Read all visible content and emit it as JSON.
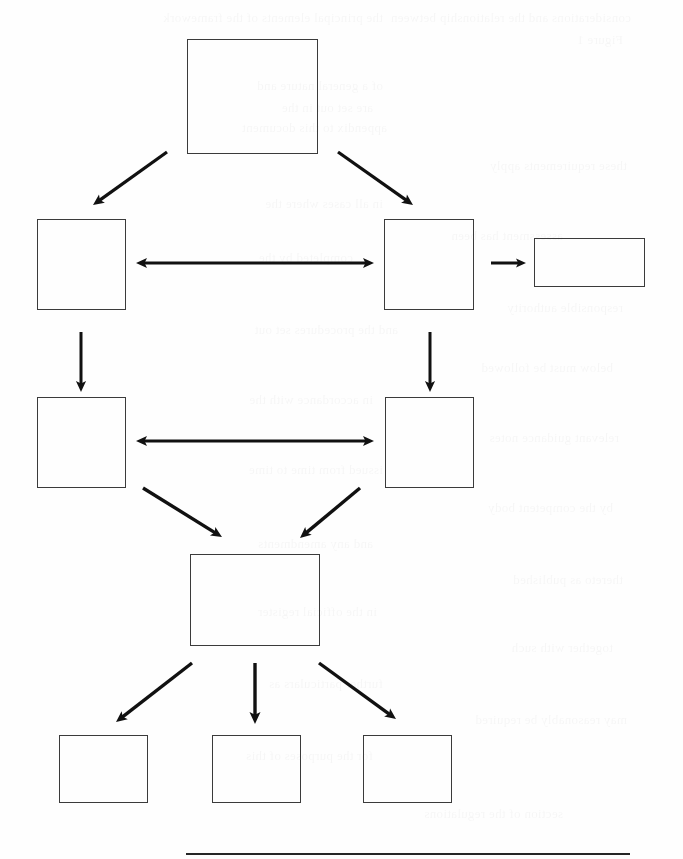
{
  "page": {
    "width": 683,
    "height": 859,
    "background_color": "#fefefe",
    "stroke_color": "#3b3b3b",
    "arrow_color": "#111111",
    "rule_color": "#262626"
  },
  "diagram": {
    "type": "flowchart",
    "orientation": "top-down",
    "node_count": 9,
    "arrow_count": 12,
    "nodes_have_labels": false,
    "nodes": [
      {
        "id": "node-root",
        "name": "root-node",
        "row": 1,
        "label": "",
        "x": 187,
        "y": 39,
        "width": 131,
        "height": 115
      },
      {
        "id": "node-left-upper",
        "name": "left-upper-node",
        "row": 2,
        "label": "",
        "x": 37,
        "y": 219,
        "width": 89,
        "height": 91
      },
      {
        "id": "node-right-upper",
        "name": "right-upper-node",
        "row": 2,
        "label": "",
        "x": 384,
        "y": 219,
        "width": 90,
        "height": 91
      },
      {
        "id": "node-side",
        "name": "side-output-node",
        "row": 2,
        "label": "",
        "x": 534,
        "y": 238,
        "width": 111,
        "height": 49
      },
      {
        "id": "node-left-lower",
        "name": "left-lower-node",
        "row": 3,
        "label": "",
        "x": 37,
        "y": 397,
        "width": 89,
        "height": 91
      },
      {
        "id": "node-right-lower",
        "name": "right-lower-node",
        "row": 3,
        "label": "",
        "x": 385,
        "y": 397,
        "width": 89,
        "height": 91
      },
      {
        "id": "node-merge",
        "name": "merge-node",
        "row": 4,
        "label": "",
        "x": 190,
        "y": 554,
        "width": 130,
        "height": 92
      },
      {
        "id": "node-leaf-1",
        "name": "leaf-node-1",
        "row": 5,
        "label": "",
        "x": 59,
        "y": 735,
        "width": 89,
        "height": 68
      },
      {
        "id": "node-leaf-2",
        "name": "leaf-node-2",
        "row": 5,
        "label": "",
        "x": 212,
        "y": 735,
        "width": 89,
        "height": 68
      },
      {
        "id": "node-leaf-3",
        "name": "leaf-node-3",
        "row": 5,
        "label": "",
        "x": 363,
        "y": 735,
        "width": 89,
        "height": 68
      }
    ],
    "arrows": [
      {
        "id": "arrow-root-to-left-upper",
        "name": "arrow-root-to-left-upper",
        "style": "diagonal",
        "direction": "single",
        "from": "node-root",
        "to": "node-left-upper",
        "x1": 167,
        "y1": 152,
        "x2": 93,
        "y2": 205,
        "width": 3.2,
        "head": 11
      },
      {
        "id": "arrow-root-to-right-upper",
        "name": "arrow-root-to-right-upper",
        "style": "diagonal",
        "direction": "single",
        "from": "node-root",
        "to": "node-right-upper",
        "x1": 338,
        "y1": 152,
        "x2": 413,
        "y2": 205,
        "width": 3.2,
        "head": 11
      },
      {
        "id": "arrow-upper-bidirectional",
        "name": "arrow-upper-bidirectional",
        "style": "horizontal",
        "direction": "double",
        "from": "node-left-upper",
        "to": "node-right-upper",
        "x1": 136,
        "y1": 263,
        "x2": 374,
        "y2": 263,
        "width": 3.0,
        "head": 11
      },
      {
        "id": "arrow-right-upper-to-side",
        "name": "arrow-right-upper-to-side",
        "style": "horizontal",
        "direction": "single",
        "from": "node-right-upper",
        "to": "node-side",
        "x1": 491,
        "y1": 263,
        "x2": 526,
        "y2": 263,
        "width": 3.0,
        "head": 10
      },
      {
        "id": "arrow-left-upper-to-left-lower",
        "name": "arrow-left-upper-to-left-lower",
        "style": "vertical",
        "direction": "single",
        "from": "node-left-upper",
        "to": "node-left-lower",
        "x1": 81,
        "y1": 332,
        "x2": 81,
        "y2": 392,
        "width": 3.0,
        "head": 11
      },
      {
        "id": "arrow-right-upper-to-right-lower",
        "name": "arrow-right-upper-to-right-lower",
        "style": "vertical",
        "direction": "single",
        "from": "node-right-upper",
        "to": "node-right-lower",
        "x1": 430,
        "y1": 332,
        "x2": 430,
        "y2": 392,
        "width": 3.0,
        "head": 11
      },
      {
        "id": "arrow-lower-bidirectional",
        "name": "arrow-lower-bidirectional",
        "style": "horizontal",
        "direction": "double",
        "from": "node-left-lower",
        "to": "node-right-lower",
        "x1": 136,
        "y1": 441,
        "x2": 374,
        "y2": 441,
        "width": 3.0,
        "head": 11
      },
      {
        "id": "arrow-left-lower-to-merge",
        "name": "arrow-left-lower-to-merge",
        "style": "diagonal",
        "direction": "single",
        "from": "node-left-lower",
        "to": "node-merge",
        "x1": 143,
        "y1": 488,
        "x2": 222,
        "y2": 537,
        "width": 3.4,
        "head": 11
      },
      {
        "id": "arrow-right-lower-to-merge",
        "name": "arrow-right-lower-to-merge",
        "style": "diagonal",
        "direction": "single",
        "from": "node-right-lower",
        "to": "node-merge",
        "x1": 360,
        "y1": 488,
        "x2": 300,
        "y2": 538,
        "width": 3.4,
        "head": 11
      },
      {
        "id": "arrow-merge-to-leaf-1",
        "name": "arrow-merge-to-leaf-1",
        "style": "diagonal",
        "direction": "single",
        "from": "node-merge",
        "to": "node-leaf-1",
        "x1": 192,
        "y1": 663,
        "x2": 116,
        "y2": 722,
        "width": 3.4,
        "head": 11
      },
      {
        "id": "arrow-merge-to-leaf-2",
        "name": "arrow-merge-to-leaf-2",
        "style": "vertical",
        "direction": "single",
        "from": "node-merge",
        "to": "node-leaf-2",
        "x1": 255,
        "y1": 663,
        "x2": 255,
        "y2": 724,
        "width": 3.4,
        "head": 12
      },
      {
        "id": "arrow-merge-to-leaf-3",
        "name": "arrow-merge-to-leaf-3",
        "style": "diagonal",
        "direction": "single",
        "from": "node-merge",
        "to": "node-leaf-3",
        "x1": 319,
        "y1": 663,
        "x2": 396,
        "y2": 719,
        "width": 3.4,
        "head": 11
      }
    ]
  },
  "bottom_rule": {
    "name": "bottom-horizontal-rule",
    "x": 186,
    "y": 853,
    "width": 444,
    "height": 2
  },
  "ghost_text": {
    "description": "faint mirrored bleed-through from reverse side of scanned page",
    "lines": [
      {
        "text": "considerations and the relationship between",
        "x": 52,
        "y": 10,
        "size": 13
      },
      {
        "text": "the principal elements of the framework",
        "x": 300,
        "y": 10,
        "size": 13
      },
      {
        "text": "Figure 1",
        "x": 60,
        "y": 32,
        "size": 13
      },
      {
        "text": "of a general nature and",
        "x": 300,
        "y": 78,
        "size": 13
      },
      {
        "text": "are set out in the",
        "x": 310,
        "y": 100,
        "size": 13
      },
      {
        "text": "appendix to this document",
        "x": 296,
        "y": 120,
        "size": 13
      },
      {
        "text": "these requirements apply",
        "x": 56,
        "y": 158,
        "size": 13
      },
      {
        "text": "in all cases where the",
        "x": 300,
        "y": 196,
        "size": 13
      },
      {
        "text": "assessment has been",
        "x": 120,
        "y": 228,
        "size": 13
      },
      {
        "text": "completed by the",
        "x": 330,
        "y": 250,
        "size": 13
      },
      {
        "text": "responsible authority",
        "x": 60,
        "y": 300,
        "size": 13
      },
      {
        "text": "and the procedures set out",
        "x": 285,
        "y": 322,
        "size": 13
      },
      {
        "text": "below must be followed",
        "x": 70,
        "y": 360,
        "size": 13
      },
      {
        "text": "in accordance with the",
        "x": 310,
        "y": 392,
        "size": 13
      },
      {
        "text": "relevant guidance notes",
        "x": 64,
        "y": 430,
        "size": 13
      },
      {
        "text": "issued from time to time",
        "x": 300,
        "y": 462,
        "size": 13
      },
      {
        "text": "by the competent body",
        "x": 70,
        "y": 500,
        "size": 13
      },
      {
        "text": "and any amendments",
        "x": 310,
        "y": 536,
        "size": 13
      },
      {
        "text": "thereto as published",
        "x": 60,
        "y": 572,
        "size": 13
      },
      {
        "text": "in the official register",
        "x": 306,
        "y": 604,
        "size": 13
      },
      {
        "text": "together with such",
        "x": 70,
        "y": 640,
        "size": 13
      },
      {
        "text": "further particulars as",
        "x": 300,
        "y": 676,
        "size": 13
      },
      {
        "text": "may reasonably be required",
        "x": 56,
        "y": 712,
        "size": 13
      },
      {
        "text": "for the purposes of this",
        "x": 310,
        "y": 748,
        "size": 13
      },
      {
        "text": "section of the regulations",
        "x": 120,
        "y": 806,
        "size": 13
      }
    ]
  }
}
